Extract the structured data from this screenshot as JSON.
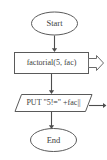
{
  "diagram": {
    "type": "flowchart",
    "background_color": "#ffffff",
    "line_color": "#5a5a5a",
    "text_color": "#3d3d3d",
    "nodes": [
      {
        "id": "start",
        "shape": "oval",
        "role": "terminal",
        "label": "Start"
      },
      {
        "id": "call-factorial",
        "shape": "rectangle",
        "role": "process",
        "label": "factorial(5, fac)"
      },
      {
        "id": "put-output",
        "shape": "parallelogram",
        "role": "output",
        "label": "PUT \"5!=\" +fac||"
      },
      {
        "id": "end",
        "shape": "oval",
        "role": "terminal",
        "label": "End"
      }
    ],
    "connectors": [
      {
        "id": "start-to-process",
        "from": "start",
        "to": "call-factorial",
        "direction": "down"
      },
      {
        "id": "process-to-output",
        "from": "call-factorial",
        "to": "put-output",
        "direction": "down"
      },
      {
        "id": "output-to-end",
        "from": "put-output",
        "to": "end",
        "direction": "down"
      }
    ],
    "markers": [
      {
        "id": "process-chevron",
        "attached_to": "call-factorial",
        "shape": "hollow-chevron",
        "direction": "right"
      },
      {
        "id": "output-arrow",
        "attached_to": "put-output",
        "shape": "line-arrow",
        "direction": "right"
      }
    ]
  }
}
